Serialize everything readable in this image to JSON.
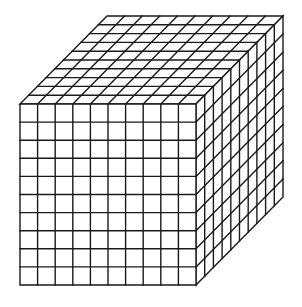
{
  "diagram": {
    "type": "cube-grid",
    "divisions": 10,
    "line_color": "#1a1a1a",
    "background": "#ffffff",
    "geometry": {
      "front_face": {
        "x0": 20,
        "y0": 104,
        "x1": 196,
        "y1": 285
      },
      "depth_offset": {
        "dx": 87,
        "dy": -88
      }
    },
    "faces": [
      "front",
      "top",
      "right"
    ]
  }
}
